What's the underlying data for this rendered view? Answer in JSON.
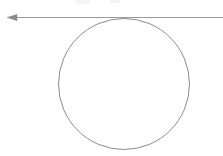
{
  "figure": {
    "background_color": "#ffffff",
    "width": 223,
    "height": 156,
    "stroke_color": "#8a8a8a",
    "circle_stroke_color": "#8e8e8e",
    "line_stroke_color": "#9a9a9a",
    "stroke_width": 1
  },
  "elements": {
    "tangent_line": {
      "name": "horizontal tangent line",
      "x1": 10,
      "y1": 17.5,
      "x2": 223,
      "y2": 17.5,
      "label": ""
    },
    "arrow_head": {
      "name": "left arrowhead",
      "direction": "left",
      "tip_x": 7,
      "tip_y": 17.5,
      "base_x": 17,
      "half_height": 3.2,
      "label": ""
    },
    "circle": {
      "name": "circle tangent to line",
      "cx": 124,
      "cy": 84,
      "r": 65.5,
      "left": 58.5,
      "right": 189.5,
      "top": 18.5,
      "bottom": 149.5,
      "diameter": 131,
      "label": ""
    },
    "tangent_point": {
      "name": "point of tangency",
      "x": 124,
      "y": 18.5,
      "label": ""
    }
  },
  "artifacts": [
    {
      "name": "faint-mark-left",
      "x": 76,
      "y": 0,
      "width": 14,
      "height": 4
    },
    {
      "name": "faint-mark-right",
      "x": 110,
      "y": 0,
      "width": 10,
      "height": 3
    }
  ],
  "chart_data": {
    "type": "diagram",
    "shapes": [
      {
        "kind": "line",
        "role": "tangent",
        "from": [
          10,
          17.5
        ],
        "to": [
          223,
          17.5
        ],
        "arrow": "start",
        "color": "#9a9a9a"
      },
      {
        "kind": "circle",
        "role": "circle",
        "center": [
          124,
          84
        ],
        "radius": 65.5,
        "fill": "none",
        "color": "#8e8e8e"
      }
    ],
    "annotations": [],
    "xlabel": "",
    "ylabel": "",
    "legend": []
  }
}
